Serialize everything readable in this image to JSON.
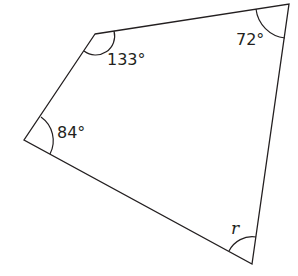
{
  "diagram": {
    "type": "quadrilateral",
    "vertices": {
      "top_left": [
        95,
        34
      ],
      "top_right": [
        289,
        4
      ],
      "bottom_right": [
        252,
        264
      ],
      "left": [
        24,
        140
      ]
    },
    "angles": [
      {
        "vertex": "top_left",
        "label": "133°"
      },
      {
        "vertex": "top_right",
        "label": "72°"
      },
      {
        "vertex": "left",
        "label": "84°"
      },
      {
        "vertex": "bottom_right",
        "label": "r"
      }
    ],
    "stroke_color": "#231f20"
  }
}
